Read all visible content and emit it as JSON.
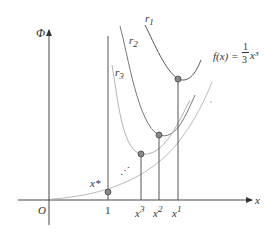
{
  "axes": {
    "y_label": "Φ",
    "x_label": "x",
    "origin_label": "O"
  },
  "function_label": {
    "lhs": "f(x) =",
    "numerator": "1",
    "denominator": "3",
    "rhs": "x³"
  },
  "curves": [
    {
      "name": "r",
      "sub": "1"
    },
    {
      "name": "r",
      "sub": "2"
    },
    {
      "name": "r",
      "sub": "3"
    }
  ],
  "x_ticks": [
    {
      "label": "1"
    },
    {
      "label": "x",
      "sup": "3"
    },
    {
      "label": "x",
      "sup": "2"
    },
    {
      "label": "x",
      "sup": "1"
    }
  ],
  "point_labels": {
    "x_star": "x*",
    "ellipsis": "⋰"
  },
  "colors": {
    "axis": "#444444",
    "curve": "#555555",
    "light_curve": "#bbbbbb",
    "point_fill": "#888888"
  }
}
